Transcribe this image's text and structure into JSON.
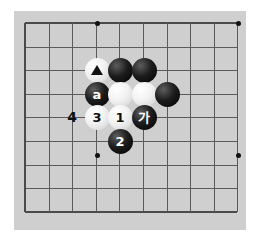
{
  "app": {
    "title": "Go board diagram",
    "background_color": "#ffffff",
    "board_color": "#cfcfcf",
    "line_color": "#5a5a5a",
    "edge_color": "#4a4a4a",
    "star_color": "#111111"
  },
  "board": {
    "grid_origin_x": 25,
    "grid_origin_y": 23,
    "grid_spacing": 23.6,
    "columns": 10,
    "rows": 9,
    "star_points": [
      {
        "cx": 97,
        "cy": 23
      },
      {
        "cx": 238,
        "cy": 23
      },
      {
        "cx": 97,
        "cy": 155
      },
      {
        "cx": 238,
        "cy": 155
      }
    ]
  },
  "stones": [
    {
      "id": "white-triangle",
      "color": "white",
      "cx": 97,
      "cy": 70,
      "label": "",
      "marker": "triangle"
    },
    {
      "id": "black-top-1",
      "color": "black",
      "cx": 120,
      "cy": 70,
      "label": "",
      "marker": ""
    },
    {
      "id": "black-top-2",
      "color": "black",
      "cx": 144,
      "cy": 70,
      "label": "",
      "marker": ""
    },
    {
      "id": "black-a",
      "color": "black",
      "cx": 97,
      "cy": 94,
      "label": "a",
      "marker": ""
    },
    {
      "id": "white-mid-1",
      "color": "white",
      "cx": 120,
      "cy": 94,
      "label": "",
      "marker": ""
    },
    {
      "id": "white-mid-2",
      "color": "white",
      "cx": 144,
      "cy": 94,
      "label": "",
      "marker": ""
    },
    {
      "id": "black-right",
      "color": "black",
      "cx": 167,
      "cy": 94,
      "label": "",
      "marker": ""
    },
    {
      "id": "white-3",
      "color": "white",
      "cx": 97,
      "cy": 117,
      "label": "3",
      "marker": ""
    },
    {
      "id": "white-1",
      "color": "white",
      "cx": 120,
      "cy": 117,
      "label": "1",
      "marker": ""
    },
    {
      "id": "black-ga",
      "color": "black",
      "cx": 144,
      "cy": 117,
      "label": "가",
      "marker": ""
    },
    {
      "id": "black-2",
      "color": "black",
      "cx": 120,
      "cy": 141,
      "label": "2",
      "marker": ""
    }
  ],
  "point_labels": [
    {
      "id": "label-4",
      "text": "4",
      "cx": 72,
      "cy": 117
    }
  ]
}
